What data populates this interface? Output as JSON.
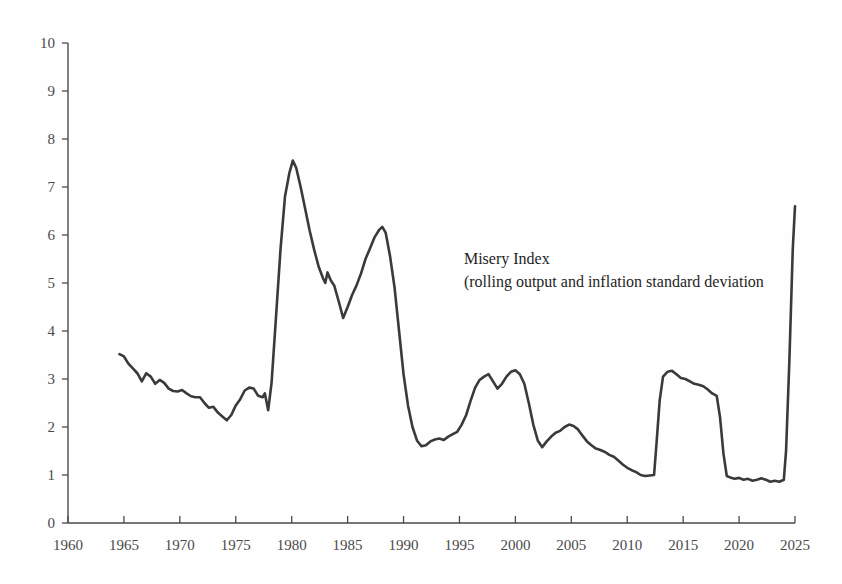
{
  "chart_data": {
    "type": "line",
    "title": "",
    "xlabel": "",
    "ylabel": "",
    "xlim": [
      1960,
      2025
    ],
    "ylim": [
      0,
      10
    ],
    "grid": false,
    "legend_position": "inside-plot-annotation",
    "annotations": [
      {
        "id": "series-label",
        "line1": "Misery Index",
        "line2": "(rolling output and inflation standard deviation",
        "x": 1995.4,
        "y": 5.4
      }
    ],
    "x_tick_labels": [
      "1960",
      "1965",
      "1970",
      "1975",
      "1980",
      "1985",
      "1990",
      "1995",
      "2000",
      "2005",
      "2010",
      "2015",
      "2020",
      "2025"
    ],
    "x_ticks": [
      1960,
      1965,
      1970,
      1975,
      1980,
      1985,
      1990,
      1995,
      2000,
      2005,
      2010,
      2015,
      2020,
      2025
    ],
    "y_tick_labels": [
      "0",
      "1",
      "2",
      "3",
      "4",
      "5",
      "6",
      "7",
      "8",
      "9",
      "10"
    ],
    "y_ticks": [
      0,
      1,
      2,
      3,
      4,
      5,
      6,
      7,
      8,
      9,
      10
    ],
    "series": [
      {
        "name": "Misery Index",
        "color": "#3a3a3a",
        "x": [
          1964.6,
          1965.0,
          1965.4,
          1965.8,
          1966.2,
          1966.6,
          1967.0,
          1967.4,
          1967.8,
          1968.2,
          1968.6,
          1969.0,
          1969.4,
          1969.8,
          1970.2,
          1970.6,
          1971.0,
          1971.4,
          1971.8,
          1972.2,
          1972.6,
          1973.0,
          1973.4,
          1973.8,
          1974.2,
          1974.6,
          1975.0,
          1975.4,
          1975.8,
          1976.2,
          1976.6,
          1977.0,
          1977.4,
          1977.6,
          1977.9,
          1978.2,
          1978.6,
          1979.0,
          1979.4,
          1979.8,
          1980.1,
          1980.4,
          1980.8,
          1981.2,
          1981.6,
          1982.0,
          1982.4,
          1982.8,
          1983.0,
          1983.2,
          1983.5,
          1983.8,
          1984.2,
          1984.6,
          1985.0,
          1985.4,
          1985.8,
          1986.2,
          1986.6,
          1987.0,
          1987.4,
          1987.8,
          1988.1,
          1988.4,
          1988.8,
          1989.2,
          1989.6,
          1990.0,
          1990.4,
          1990.8,
          1991.2,
          1991.6,
          1992.0,
          1992.4,
          1992.8,
          1993.2,
          1993.6,
          1994.0,
          1994.4,
          1994.8,
          1995.2,
          1995.6,
          1996.0,
          1996.4,
          1996.8,
          1997.2,
          1997.6,
          1998.0,
          1998.4,
          1998.8,
          1999.2,
          1999.6,
          2000.0,
          2000.4,
          2000.8,
          2001.2,
          2001.6,
          2002.0,
          2002.4,
          2002.8,
          2003.2,
          2003.6,
          2004.0,
          2004.4,
          2004.8,
          2005.2,
          2005.6,
          2006.0,
          2006.4,
          2006.8,
          2007.2,
          2007.6,
          2008.0,
          2008.4,
          2008.8,
          2009.2,
          2009.6,
          2010.0,
          2010.4,
          2010.8,
          2011.2,
          2011.6,
          2012.0,
          2012.4,
          2012.6,
          2012.9,
          2013.2,
          2013.6,
          2014.0,
          2014.4,
          2014.8,
          2015.2,
          2015.6,
          2016.0,
          2016.4,
          2016.8,
          2017.2,
          2017.6,
          2018.0,
          2018.3,
          2018.6,
          2018.9,
          2019.2,
          2019.6,
          2020.0,
          2020.4,
          2020.8,
          2021.2,
          2021.6,
          2022.0,
          2022.4,
          2022.8,
          2023.2,
          2023.6,
          2024.0,
          2024.2,
          2024.5,
          2024.8,
          2025.0
        ],
        "y": [
          3.52,
          3.47,
          3.32,
          3.22,
          3.12,
          2.95,
          3.12,
          3.05,
          2.9,
          2.98,
          2.92,
          2.8,
          2.75,
          2.74,
          2.77,
          2.7,
          2.64,
          2.62,
          2.62,
          2.5,
          2.4,
          2.42,
          2.3,
          2.22,
          2.14,
          2.25,
          2.45,
          2.58,
          2.76,
          2.82,
          2.8,
          2.65,
          2.62,
          2.7,
          2.35,
          2.92,
          4.3,
          5.7,
          6.8,
          7.3,
          7.55,
          7.4,
          7.0,
          6.55,
          6.1,
          5.7,
          5.35,
          5.1,
          5.0,
          5.22,
          5.05,
          4.95,
          4.62,
          4.27,
          4.5,
          4.75,
          4.95,
          5.2,
          5.5,
          5.72,
          5.95,
          6.1,
          6.17,
          6.05,
          5.55,
          4.9,
          4.0,
          3.1,
          2.45,
          2.0,
          1.72,
          1.6,
          1.62,
          1.7,
          1.74,
          1.76,
          1.73,
          1.8,
          1.85,
          1.9,
          2.05,
          2.25,
          2.55,
          2.82,
          2.98,
          3.05,
          3.1,
          2.95,
          2.8,
          2.9,
          3.05,
          3.15,
          3.18,
          3.1,
          2.9,
          2.5,
          2.05,
          1.72,
          1.58,
          1.7,
          1.8,
          1.88,
          1.92,
          2.0,
          2.05,
          2.02,
          1.95,
          1.82,
          1.7,
          1.62,
          1.55,
          1.52,
          1.48,
          1.42,
          1.38,
          1.3,
          1.22,
          1.15,
          1.1,
          1.06,
          1.0,
          0.98,
          0.99,
          1.0,
          1.6,
          2.55,
          3.05,
          3.15,
          3.17,
          3.1,
          3.02,
          3.0,
          2.95,
          2.9,
          2.88,
          2.85,
          2.78,
          2.7,
          2.65,
          2.2,
          1.45,
          0.98,
          0.95,
          0.92,
          0.94,
          0.9,
          0.92,
          0.88,
          0.9,
          0.93,
          0.9,
          0.86,
          0.88,
          0.86,
          0.9,
          1.5,
          3.4,
          5.7,
          6.6
        ]
      }
    ]
  },
  "axes": {
    "x_axis_name": "year-axis",
    "y_axis_name": "value-axis"
  }
}
